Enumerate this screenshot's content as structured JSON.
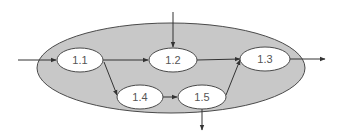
{
  "diagram": {
    "type": "process-flow",
    "colors": {
      "background": "#ffffff",
      "container_fill": "#c8c8c8",
      "stroke": "#4a4a4a",
      "node_fill": "#ffffff",
      "label": "#555555"
    },
    "container": {
      "cx": 171,
      "cy": 68,
      "rx": 134,
      "ry": 45
    },
    "nodes": [
      {
        "id": "1.1",
        "label": "1.1",
        "cx": 80,
        "cy": 60,
        "rx": 23,
        "ry": 12
      },
      {
        "id": "1.2",
        "label": "1.2",
        "cx": 173,
        "cy": 60,
        "rx": 24,
        "ry": 12
      },
      {
        "id": "1.3",
        "label": "1.3",
        "cx": 265,
        "cy": 59,
        "rx": 25,
        "ry": 12
      },
      {
        "id": "1.4",
        "label": "1.4",
        "cx": 140,
        "cy": 97,
        "rx": 23,
        "ry": 12
      },
      {
        "id": "1.5",
        "label": "1.5",
        "cx": 202,
        "cy": 97,
        "rx": 24,
        "ry": 12
      }
    ],
    "edges": [
      {
        "from": "external-input-left",
        "to": "1.1"
      },
      {
        "from": "external-input-top",
        "to": "1.2"
      },
      {
        "from": "1.1",
        "to": "1.2"
      },
      {
        "from": "1.1",
        "to": "1.4"
      },
      {
        "from": "1.4",
        "to": "1.5"
      },
      {
        "from": "1.2",
        "to": "1.3"
      },
      {
        "from": "1.5",
        "to": "1.3"
      },
      {
        "from": "1.3",
        "to": "external-output-right"
      },
      {
        "from": "1.5",
        "to": "external-output-bottom"
      }
    ]
  }
}
